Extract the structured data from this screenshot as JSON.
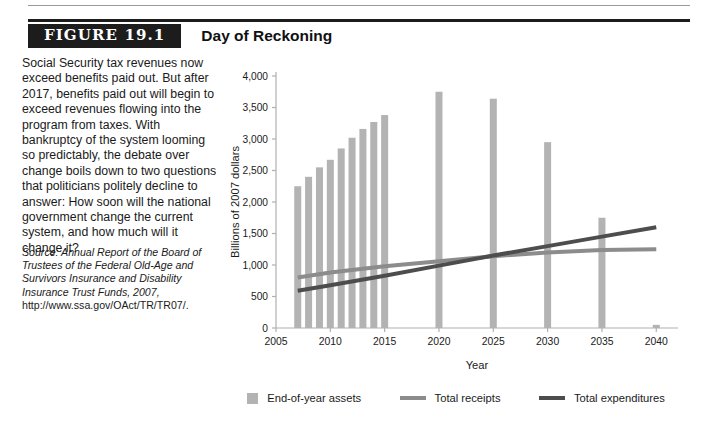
{
  "figure": {
    "tag": "FIGURE 19.1",
    "title": "Day of Reckoning"
  },
  "caption": "Social Security tax revenues now exceed benefits paid out. But after 2017, benefits paid out will begin to exceed revenues flowing into the program from taxes. With bankruptcy of the system looming so predictably, the debate over change boils down to two questions that politicians politely decline to answer: How soon will the national government change the current system, and how much will it change it?",
  "source": {
    "italic_part": "Source: Annual Report of the Board of Trustees of the Federal Old-Age and Survivors Insurance and Disability Insurance Trust Funds, 2007,",
    "roman_part": " http://www.ssa.gov/OAct/TR/TR07/."
  },
  "legend": {
    "assets_label": "End-of-year assets",
    "receipts_label": "Total receipts",
    "expenditures_label": "Total expenditures"
  },
  "colors": {
    "assets": "#b3b3b3",
    "receipts": "#8c8c8c",
    "expenditures": "#4d4d4d",
    "axis": "#b0b0b0",
    "text": "#1a1a1a"
  },
  "axis": {
    "y_ticks": [
      "0",
      "500",
      "1,000",
      "1,500",
      "2,000",
      "2,500",
      "3,000",
      "3,500",
      "4,000"
    ],
    "x_ticks": [
      "2005",
      "2010",
      "2015",
      "2020",
      "2025",
      "2030",
      "2035",
      "2040"
    ],
    "ylabel": "Billions of 2007 dollars",
    "xlabel": "Year"
  },
  "chart_data": {
    "type": "bar",
    "title": "Day of Reckoning",
    "xlabel": "Year",
    "ylabel": "Billions of 2007 dollars",
    "xlim": [
      2005,
      2042
    ],
    "ylim": [
      0,
      4000
    ],
    "ytick_step": 500,
    "grid": false,
    "legend_position": "bottom",
    "series": [
      {
        "name": "End-of-year assets",
        "type": "bar",
        "color": "#b3b3b3",
        "x": [
          2007,
          2008,
          2009,
          2010,
          2011,
          2012,
          2013,
          2014,
          2015,
          2020,
          2025,
          2030,
          2035,
          2040
        ],
        "values": [
          2250,
          2400,
          2550,
          2670,
          2850,
          3020,
          3160,
          3270,
          3380,
          3750,
          3640,
          2950,
          1750,
          50
        ]
      },
      {
        "name": "Total receipts",
        "type": "line",
        "color": "#8c8c8c",
        "x": [
          2007,
          2010,
          2015,
          2020,
          2025,
          2030,
          2035,
          2040
        ],
        "values": [
          800,
          880,
          980,
          1060,
          1140,
          1200,
          1240,
          1250
        ]
      },
      {
        "name": "Total expenditures",
        "type": "line",
        "color": "#4d4d4d",
        "x": [
          2007,
          2010,
          2015,
          2020,
          2025,
          2030,
          2035,
          2040
        ],
        "values": [
          590,
          680,
          830,
          990,
          1150,
          1300,
          1450,
          1600
        ]
      }
    ]
  }
}
